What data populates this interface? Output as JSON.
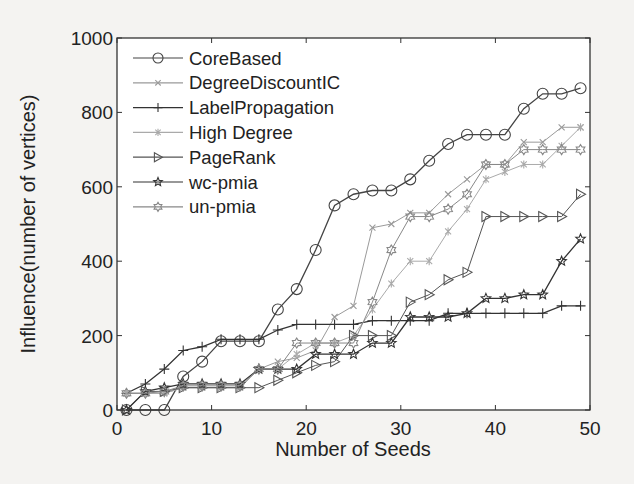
{
  "chart_data": {
    "type": "line",
    "title": "",
    "xlabel": "Number of Seeds",
    "ylabel": "Influence(number of vertices)",
    "xlim": [
      0,
      50
    ],
    "ylim": [
      0,
      1000
    ],
    "xticks": [
      0,
      10,
      20,
      30,
      40,
      50
    ],
    "yticks": [
      0,
      200,
      400,
      600,
      800,
      1000
    ],
    "grid": false,
    "legend_position": "upper left",
    "x": [
      1,
      3,
      5,
      7,
      9,
      11,
      13,
      15,
      17,
      19,
      21,
      23,
      25,
      27,
      29,
      31,
      33,
      35,
      37,
      39,
      41,
      43,
      45,
      47,
      49
    ],
    "series": [
      {
        "name": "CoreBased",
        "marker": "circle",
        "color": "#444444",
        "values": [
          0,
          0,
          0,
          90,
          130,
          185,
          185,
          185,
          270,
          325,
          430,
          550,
          580,
          590,
          590,
          620,
          670,
          715,
          740,
          740,
          740,
          810,
          850,
          850,
          865
        ]
      },
      {
        "name": "DegreeDiscountIC",
        "marker": "x",
        "color": "#9a9a9a",
        "values": [
          45,
          45,
          45,
          60,
          60,
          60,
          60,
          110,
          130,
          140,
          160,
          250,
          280,
          490,
          500,
          530,
          530,
          580,
          620,
          660,
          660,
          720,
          720,
          760,
          760
        ]
      },
      {
        "name": "LabelPropagation",
        "marker": "plus",
        "color": "#333333",
        "values": [
          45,
          70,
          110,
          160,
          170,
          190,
          190,
          190,
          215,
          230,
          230,
          230,
          230,
          240,
          240,
          240,
          240,
          260,
          260,
          260,
          260,
          260,
          260,
          280,
          280
        ]
      },
      {
        "name": "High Degree",
        "marker": "asterisk",
        "color": "#aaaaaa",
        "values": [
          45,
          45,
          45,
          60,
          60,
          60,
          60,
          110,
          110,
          150,
          180,
          180,
          200,
          270,
          340,
          400,
          400,
          480,
          540,
          620,
          640,
          660,
          660,
          710,
          760
        ]
      },
      {
        "name": "PageRank",
        "marker": "triangle-right",
        "color": "#555555",
        "values": [
          0,
          50,
          50,
          60,
          60,
          60,
          60,
          60,
          80,
          100,
          120,
          130,
          200,
          200,
          200,
          290,
          310,
          350,
          370,
          520,
          520,
          520,
          520,
          520,
          580
        ]
      },
      {
        "name": "wc-pmia",
        "marker": "star",
        "color": "#333333",
        "values": [
          0,
          50,
          60,
          70,
          70,
          70,
          70,
          110,
          110,
          110,
          150,
          150,
          150,
          180,
          180,
          250,
          250,
          250,
          260,
          300,
          300,
          310,
          310,
          400,
          460
        ]
      },
      {
        "name": "un-pmia",
        "marker": "hexagram",
        "color": "#888888",
        "values": [
          45,
          45,
          50,
          65,
          65,
          65,
          65,
          110,
          110,
          180,
          180,
          180,
          180,
          290,
          430,
          520,
          520,
          540,
          580,
          660,
          660,
          700,
          700,
          700,
          700
        ]
      }
    ]
  }
}
